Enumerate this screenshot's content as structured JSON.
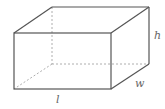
{
  "diagram": {
    "type": "rectangular-prism",
    "labels": {
      "height": "h",
      "width": "w",
      "length": "l"
    },
    "colors": {
      "edge": "#555555",
      "hidden_edge": "#999999",
      "label": "#666666"
    }
  }
}
